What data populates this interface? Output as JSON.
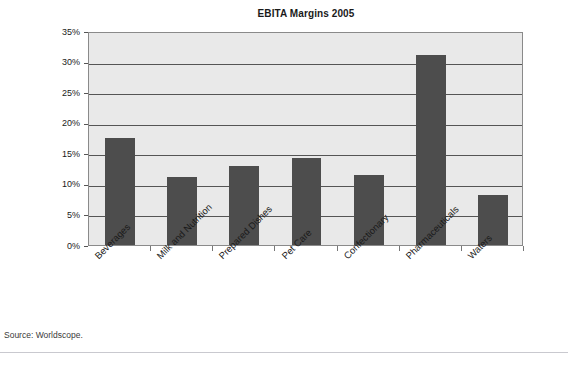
{
  "page": {
    "top_sliver_text": "",
    "source_note": "Source: Worldscope."
  },
  "chart_data": {
    "type": "bar",
    "title": "EBITA Margins 2005",
    "xlabel": "",
    "ylabel": "",
    "categories": [
      "Beverages",
      "Milk and Nutrition",
      "Prepared Dishes",
      "Pet Care",
      "Confectionary",
      "Pharmaceuticals",
      "Waters"
    ],
    "values": [
      17.5,
      11.2,
      12.9,
      14.2,
      11.5,
      31.0,
      8.2
    ],
    "value_unit": "%",
    "ylim": [
      0,
      35
    ],
    "ytick_values": [
      0,
      5,
      10,
      15,
      20,
      25,
      30,
      35
    ],
    "ytick_labels": [
      "0%",
      "5%",
      "10%",
      "15%",
      "20%",
      "25%",
      "30%",
      "35%"
    ],
    "grid": true,
    "legend": false,
    "bar_color": "#4d4d4d",
    "plot_background": "#e9e9e9",
    "axis_color": "#8a8a8a"
  }
}
